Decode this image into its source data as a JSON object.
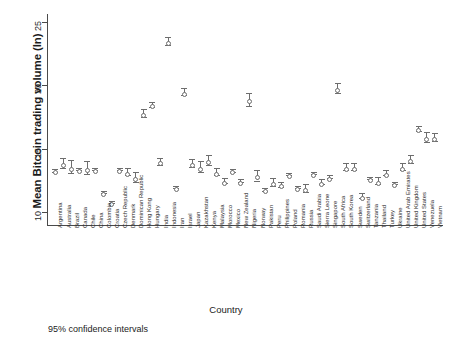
{
  "chart_data": {
    "type": "scatter",
    "title": "",
    "subtitle": "",
    "xlabel": "Country",
    "ylabel": "Mean Bitcoin trading volume (ln)",
    "note": "95% confidence intervals",
    "ylim": [
      9.0,
      25.6
    ],
    "yticks": [
      10,
      15,
      20,
      25
    ],
    "ytick_labels": [
      "10",
      "15",
      "20",
      "25"
    ],
    "grid": false,
    "legend": "none",
    "error_kind": "95% confidence interval",
    "categories": [
      "Argentina",
      "Australia",
      "Brazil",
      "Canada",
      "Chile",
      "China",
      "Colombia",
      "Croatia",
      "Czech Republic",
      "Denmark",
      "Dominican Republic",
      "Hong Kong",
      "Hungary",
      "India",
      "Indonesia",
      "Iran",
      "Israel",
      "Japan",
      "Kazakhstan",
      "Kenya",
      "Malaysia",
      "Morocco",
      "Mexico",
      "New Zealand",
      "Nigeria",
      "Norway",
      "Pakistan",
      "Peru",
      "Philippines",
      "Poland",
      "Romania",
      "Russia",
      "Saudi Arabia",
      "Sierra Leone",
      "Singapore",
      "South Africa",
      "South Korea",
      "Sweden",
      "Switzerland",
      "Tanzania",
      "Thailand",
      "Turkey",
      "Ukraine",
      "United Arab Emirates",
      "United Kingdom",
      "United States",
      "Venezuela",
      "Vietnam"
    ],
    "values": [
      13.3,
      13.9,
      13.6,
      13.4,
      13.5,
      13.4,
      11.6,
      10.8,
      13.4,
      13.2,
      12.8,
      17.8,
      18.5,
      14.0,
      23.5,
      12.0,
      19.5,
      13.9,
      13.6,
      14.1,
      13.2,
      12.5,
      13.3,
      12.5,
      18.9,
      12.9,
      11.8,
      12.4,
      12.2,
      13.0,
      12.0,
      11.9,
      13.1,
      12.4,
      12.8,
      19.8,
      13.6,
      13.6,
      11.3,
      12.7,
      12.5,
      13.1,
      12.3,
      13.6,
      14.2,
      16.6,
      15.9,
      15.9
    ],
    "ci_low": [
      13.2,
      13.5,
      13.1,
      13.3,
      13.0,
      13.3,
      11.5,
      10.7,
      13.3,
      12.9,
      12.4,
      17.5,
      18.3,
      13.7,
      23.2,
      11.9,
      19.2,
      13.6,
      13.2,
      13.7,
      12.9,
      12.3,
      13.2,
      12.4,
      18.4,
      12.5,
      11.7,
      12.1,
      12.0,
      12.9,
      11.9,
      11.6,
      13.0,
      12.2,
      12.7,
      19.4,
      13.3,
      13.3,
      11.1,
      12.6,
      12.2,
      12.9,
      12.2,
      13.3,
      13.9,
      16.4,
      15.5,
      15.6
    ],
    "ci_high": [
      13.4,
      14.3,
      14.1,
      13.5,
      14.0,
      13.5,
      11.7,
      10.9,
      13.5,
      13.5,
      13.2,
      18.1,
      18.7,
      14.3,
      23.8,
      12.1,
      19.8,
      14.2,
      14.0,
      14.5,
      13.5,
      12.7,
      13.4,
      12.6,
      19.4,
      13.3,
      11.9,
      12.7,
      12.4,
      13.1,
      12.1,
      12.2,
      13.2,
      12.6,
      12.9,
      20.2,
      13.9,
      13.9,
      11.5,
      12.8,
      12.8,
      13.3,
      12.4,
      13.9,
      14.5,
      16.8,
      16.3,
      16.2
    ]
  },
  "figure": {
    "axis_color": "#4a4a4a",
    "marker_color": "#6d6d6d",
    "background": "#ffffff"
  }
}
